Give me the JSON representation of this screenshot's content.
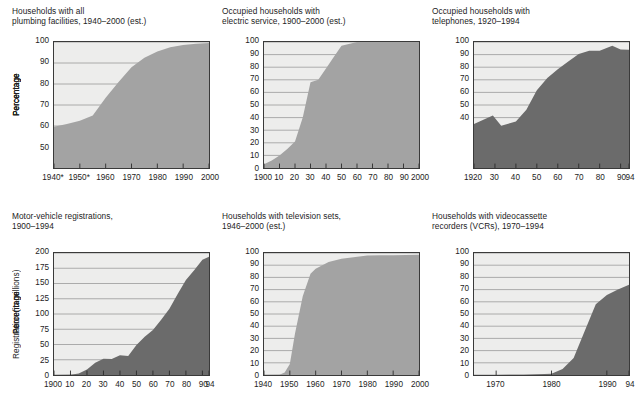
{
  "figure": {
    "kind": "six-panel area chart grid",
    "background_color": "#ffffff",
    "panel_face_color": "#ededec",
    "gridline_color": "#8d8d8d",
    "frame_color": "#3a3a3a",
    "fill_light": "#a3a3a3",
    "fill_dark": "#6b6b6b"
  },
  "charts": [
    {
      "id": "plumbing",
      "title": "Households with all\nplumbing facilities, 1940–2000 (est.)",
      "chart_data": {
        "type": "area",
        "title": "Households with all plumbing facilities, 1940–2000 (est.)",
        "xlabel": "",
        "ylabel": "Percentage",
        "xlim": [
          1940,
          2000
        ],
        "ylim": [
          40,
          100
        ],
        "grid": true,
        "fill_color": "#a3a3a3",
        "yticks": [
          50,
          60,
          70,
          80,
          90,
          100
        ],
        "xticks": [
          1940,
          1950,
          1960,
          1970,
          1980,
          1990,
          2000
        ],
        "xticklabels": [
          "1940*",
          "1950*",
          "1960",
          "1970",
          "1980",
          "1990",
          "2000"
        ],
        "x": [
          1940,
          1945,
          1950,
          1955,
          1960,
          1965,
          1970,
          1975,
          1980,
          1985,
          1990,
          1995,
          2000
        ],
        "values": [
          59.7,
          61.0,
          62.5,
          65.0,
          73.5,
          81.0,
          88.0,
          92.5,
          95.5,
          97.5,
          98.6,
          99.2,
          99.5
        ]
      }
    },
    {
      "id": "electric",
      "title": "Occupied households with\nelectric service, 1900–2000 (est.)",
      "chart_data": {
        "type": "area",
        "title": "Occupied households with electric service, 1900–2000 (est.)",
        "xlabel": "",
        "ylabel": "Percentage",
        "xlim": [
          1900,
          2000
        ],
        "ylim": [
          0,
          100
        ],
        "grid": true,
        "fill_color": "#a3a3a3",
        "yticks": [
          0,
          10,
          20,
          30,
          40,
          50,
          60,
          70,
          80,
          90,
          100
        ],
        "xticks": [
          1900,
          1910,
          1920,
          1930,
          1940,
          1950,
          1960,
          1970,
          1980,
          1990,
          2000
        ],
        "xticklabels": [
          "1900",
          "10",
          "20",
          "30",
          "40",
          "50",
          "60",
          "70",
          "80",
          "90",
          "2000"
        ],
        "x": [
          1900,
          1905,
          1910,
          1915,
          1920,
          1925,
          1930,
          1935,
          1940,
          1945,
          1950,
          1960,
          1970,
          1980,
          1990,
          2000
        ],
        "values": [
          3.0,
          6.0,
          10.0,
          15.0,
          21.0,
          40.0,
          68.0,
          70.0,
          79.0,
          88.0,
          97.0,
          100.0,
          100.0,
          100.0,
          100.0,
          100.0
        ]
      }
    },
    {
      "id": "telephones",
      "title": "Occupied households with\ntelephones, 1920–1994",
      "chart_data": {
        "type": "area",
        "title": "Occupied households with telephones, 1920–1994",
        "xlabel": "",
        "ylabel": "Percentage",
        "xlim": [
          1920,
          1994
        ],
        "ylim": [
          0,
          100
        ],
        "grid": true,
        "fill_color": "#6b6b6b",
        "yticks": [
          40,
          50,
          60,
          70,
          80,
          90,
          100
        ],
        "xticks": [
          1920,
          1930,
          1940,
          1950,
          1960,
          1970,
          1980,
          1990,
          1994
        ],
        "xticklabels": [
          "1920",
          "30",
          "40",
          "50",
          "60",
          "70",
          "80",
          "90",
          "94"
        ],
        "x": [
          1920,
          1925,
          1929,
          1933,
          1940,
          1945,
          1950,
          1955,
          1960,
          1965,
          1970,
          1975,
          1980,
          1986,
          1990,
          1994
        ],
        "values": [
          35.0,
          38.7,
          41.6,
          33.5,
          36.9,
          46.2,
          61.8,
          71.5,
          78.3,
          84.6,
          90.5,
          93.0,
          93.0,
          97.0,
          94.0,
          93.8
        ]
      }
    },
    {
      "id": "motor-vehicles",
      "title": "Motor-vehicle registrations,\n1900–1994",
      "chart_data": {
        "type": "area",
        "title": "Motor-vehicle registrations, 1900–1994",
        "xlabel": "",
        "ylabel": "Registration (in millions)",
        "xlim": [
          1900,
          1994
        ],
        "ylim": [
          0,
          200
        ],
        "grid": true,
        "fill_color": "#6b6b6b",
        "yticks": [
          0,
          25,
          50,
          75,
          100,
          125,
          150,
          175,
          200
        ],
        "xticks": [
          1900,
          1910,
          1920,
          1930,
          1940,
          1950,
          1960,
          1970,
          1980,
          1990,
          1994
        ],
        "xticklabels": [
          "1900",
          "10",
          "20",
          "30",
          "40",
          "50",
          "60",
          "70",
          "80",
          "90",
          "94"
        ],
        "x": [
          1900,
          1910,
          1915,
          1920,
          1925,
          1930,
          1935,
          1940,
          1945,
          1950,
          1955,
          1960,
          1965,
          1970,
          1975,
          1980,
          1985,
          1990,
          1994
        ],
        "values": [
          0.008,
          0.5,
          2.5,
          9.2,
          20.0,
          26.7,
          26.2,
          32.4,
          31.0,
          49.2,
          62.7,
          73.9,
          90.4,
          108.4,
          132.9,
          155.8,
          171.7,
          188.8,
          194.0
        ]
      }
    },
    {
      "id": "television",
      "title": "Households with television sets,\n1946–2000 (est.)",
      "chart_data": {
        "type": "area",
        "title": "Households with television sets, 1946–2000 (est.)",
        "xlabel": "",
        "ylabel": "Percentage",
        "xlim": [
          1940,
          2000
        ],
        "ylim": [
          0,
          100
        ],
        "grid": true,
        "fill_color": "#a3a3a3",
        "yticks": [
          0,
          10,
          20,
          30,
          40,
          50,
          60,
          70,
          80,
          90,
          100
        ],
        "xticks": [
          1940,
          1950,
          1960,
          1970,
          1980,
          1990,
          2000
        ],
        "xticklabels": [
          "1940",
          "1950",
          "1960",
          "1970",
          "1980",
          "1990",
          "2000"
        ],
        "x": [
          1940,
          1946,
          1948,
          1950,
          1952,
          1955,
          1958,
          1960,
          1965,
          1970,
          1980,
          1985,
          1990,
          2000
        ],
        "values": [
          0.0,
          0.2,
          2.0,
          9.0,
          34.0,
          64.5,
          83.0,
          87.1,
          92.6,
          95.3,
          97.9,
          98.1,
          98.2,
          98.6
        ]
      }
    },
    {
      "id": "vcr",
      "title": "Households with videocassette\nrecorders (VCRs), 1970–1994",
      "chart_data": {
        "type": "area",
        "title": "Households with videocassette recorders (VCRs), 1970–1994",
        "xlabel": "",
        "ylabel": "Percentage",
        "xlim": [
          1966,
          1994
        ],
        "ylim": [
          0,
          100
        ],
        "grid": true,
        "fill_color": "#6b6b6b",
        "yticks": [
          0,
          10,
          20,
          30,
          40,
          50,
          60,
          70,
          80,
          90,
          100
        ],
        "xticks": [
          1970,
          1980,
          1990,
          1994
        ],
        "xticklabels": [
          "1970",
          "1980",
          "1990",
          "94"
        ],
        "x": [
          1966,
          1970,
          1975,
          1980,
          1982,
          1984,
          1986,
          1988,
          1990,
          1992,
          1994
        ],
        "values": [
          0.0,
          0.0,
          0.3,
          1.1,
          5.0,
          14.0,
          36.0,
          58.0,
          65.5,
          70.0,
          74.0
        ]
      }
    }
  ]
}
